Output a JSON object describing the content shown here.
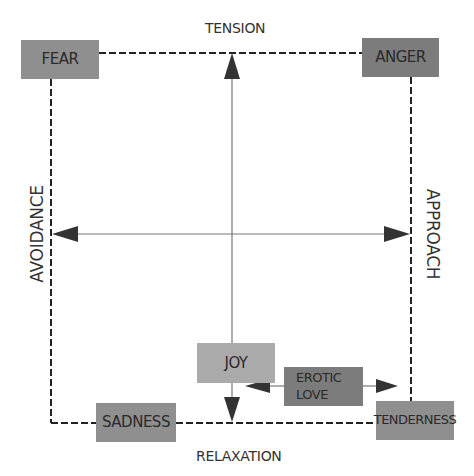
{
  "diagram": {
    "title_cropped": "",
    "axes": {
      "top": "TENSION",
      "bottom": "RELAXATION",
      "left": "AVOIDANCE",
      "right": "APPROACH"
    },
    "nodes": {
      "fear": "FEAR",
      "anger": "ANGER",
      "joy": "JOY",
      "erotic_love": "EROTIC\nLOVE",
      "sadness": "SADNESS",
      "tenderness": "TENDERNESS"
    },
    "colors": {
      "box_mid": "#8f8f8f",
      "box_dark": "#7c7c7c",
      "box_light": "#aaaaaa",
      "line": "#222222",
      "axis_line": "#777777"
    }
  }
}
